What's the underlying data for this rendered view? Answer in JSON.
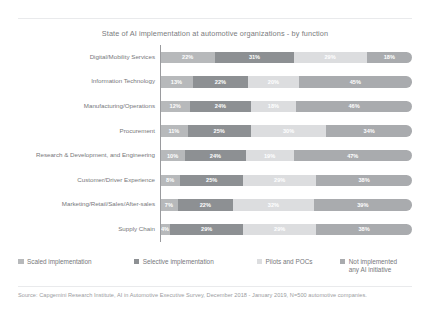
{
  "chart_data": {
    "type": "bar",
    "orientation": "horizontal",
    "stacked": true,
    "title": "State of AI implementation at automotive organizations - by function",
    "xlabel": "",
    "ylabel": "",
    "xlim": [
      0,
      100
    ],
    "grid": false,
    "legend_position": "bottom",
    "unit": "%",
    "categories": [
      "Digital/Mobility Services",
      "Information Technology",
      "Manufacturing/Operations",
      "Procurement",
      "Research & Development, and Engineering",
      "Customer/Driver Experience",
      "Marketing/Retail/Sales/After-sales",
      "Supply Chain"
    ],
    "series": [
      {
        "name": "Scaled implementation",
        "color": "#b7b9bb",
        "values": [
          22,
          13,
          12,
          11,
          10,
          8,
          7,
          4
        ],
        "labels": [
          "22%",
          "13%",
          "12%",
          "11%",
          "10%",
          "8%",
          "7%",
          "4%"
        ]
      },
      {
        "name": "Selective implementation",
        "color": "#8d9093",
        "values": [
          31,
          22,
          24,
          25,
          24,
          25,
          22,
          29
        ],
        "labels": [
          "31%",
          "22%",
          "24%",
          "25%",
          "24%",
          "25%",
          "22%",
          "29%"
        ]
      },
      {
        "name": "Pilots and POCs",
        "color": "#dcdddf",
        "values": [
          29,
          20,
          18,
          30,
          19,
          29,
          32,
          29
        ],
        "labels": [
          "29%",
          "20%",
          "18%",
          "30%",
          "19%",
          "29%",
          "32%",
          "29%"
        ]
      },
      {
        "name": "Not implemented any AI initiative",
        "color": "#a9abae",
        "values": [
          18,
          45,
          46,
          34,
          47,
          38,
          39,
          38
        ],
        "labels": [
          "18%",
          "45%",
          "46%",
          "34%",
          "47%",
          "38%",
          "39%",
          "38%"
        ]
      }
    ]
  },
  "legend": {
    "items": [
      {
        "label": "Scaled implementation",
        "color": "#b7b9bb"
      },
      {
        "label": "Selective implementation",
        "color": "#8d9093"
      },
      {
        "label": "Pilots and POCs",
        "color": "#dcdddf"
      },
      {
        "label": "Not implemented\nany AI initiative",
        "color": "#a9abae"
      }
    ]
  },
  "source": {
    "text": "Source: Capgemini Research Institute, AI in Automotive Executive Survey, December 2018 - January 2019, N=500 automotive companies."
  }
}
